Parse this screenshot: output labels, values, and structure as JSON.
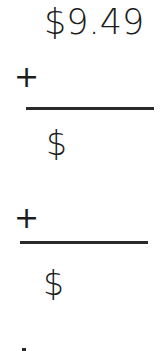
{
  "worksheet": {
    "top_value": "$9.49",
    "rows": [
      {
        "operator": "+",
        "answer_prefix": "$"
      },
      {
        "operator": "+",
        "answer_prefix": "$"
      }
    ]
  },
  "colors": {
    "ink": "#1c1c1c",
    "rule": "#2a2a2a",
    "background": "#ffffff"
  }
}
